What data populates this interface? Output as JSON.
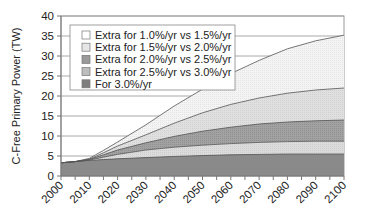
{
  "chart_data": {
    "type": "area",
    "stacked": true,
    "title": "",
    "xlabel": "",
    "ylabel": "C-Free Primary Power (TW)",
    "xlim": [
      2000,
      2100
    ],
    "ylim": [
      0,
      40
    ],
    "x_ticks": [
      2000,
      2010,
      2020,
      2030,
      2040,
      2050,
      2060,
      2070,
      2080,
      2090,
      2100
    ],
    "y_ticks": [
      0,
      5,
      10,
      15,
      20,
      25,
      30,
      35,
      40
    ],
    "grid": {
      "horizontal": true,
      "vertical": false
    },
    "legend_position": "upper-left-inside",
    "x": [
      2000,
      2005,
      2010,
      2015,
      2020,
      2030,
      2040,
      2050,
      2060,
      2070,
      2080,
      2090,
      2100
    ],
    "cumulative_boundaries": [
      {
        "name": "For 3.0%/yr",
        "values": [
          3.3,
          3.6,
          3.9,
          4.1,
          4.3,
          4.6,
          4.9,
          5.1,
          5.3,
          5.4,
          5.5,
          5.5,
          5.5
        ]
      },
      {
        "name": "Total at 2.5%/yr",
        "values": [
          3.3,
          3.6,
          4.0,
          4.7,
          5.4,
          6.5,
          7.2,
          7.7,
          8.1,
          8.4,
          8.6,
          8.7,
          8.7
        ]
      },
      {
        "name": "Total at 2.0%/yr",
        "values": [
          3.3,
          3.6,
          4.1,
          5.3,
          6.5,
          8.3,
          9.9,
          11.2,
          12.2,
          13.0,
          13.5,
          13.8,
          14.0
        ]
      },
      {
        "name": "Total at 1.5%/yr",
        "values": [
          3.3,
          3.6,
          4.2,
          5.8,
          7.5,
          10.3,
          13.2,
          15.8,
          17.9,
          19.5,
          20.7,
          21.5,
          22.0
        ]
      },
      {
        "name": "Total at 1.0%/yr",
        "values": [
          3.3,
          3.6,
          4.4,
          6.4,
          8.5,
          12.8,
          17.5,
          21.7,
          25.6,
          28.9,
          31.8,
          33.8,
          35.2
        ]
      }
    ],
    "series": [
      {
        "name": "For 3.0%/yr",
        "color": "#8a8a8a",
        "values": [
          3.3,
          3.6,
          3.9,
          4.1,
          4.3,
          4.6,
          4.9,
          5.1,
          5.3,
          5.4,
          5.5,
          5.5,
          5.5
        ]
      },
      {
        "name": "Extra for 2.5%/yr vs 3.0%/yr",
        "color": "#b4b4b4",
        "values": [
          0,
          0,
          0.1,
          0.6,
          1.1,
          1.9,
          2.3,
          2.6,
          2.8,
          3.0,
          3.1,
          3.2,
          3.2
        ]
      },
      {
        "name": "Extra for 2.0%/yr vs 2.5%/yr",
        "color": "#9c9c9c",
        "values": [
          0,
          0,
          0.1,
          0.6,
          1.1,
          1.8,
          2.7,
          3.5,
          4.1,
          4.6,
          4.9,
          5.1,
          5.3
        ]
      },
      {
        "name": "Extra for 1.5%/yr vs 2.0%/yr",
        "color": "#dedede",
        "values": [
          0,
          0,
          0.1,
          0.5,
          1.0,
          2.0,
          3.3,
          4.6,
          5.7,
          6.5,
          7.2,
          7.7,
          8.0
        ]
      },
      {
        "name": "Extra for 1.0%/yr vs 1.5%/yr",
        "color": "#f2f2f2",
        "values": [
          0,
          0,
          0.2,
          0.6,
          1.0,
          2.5,
          4.3,
          5.9,
          7.7,
          9.4,
          11.1,
          12.3,
          13.2
        ]
      }
    ]
  },
  "chart": {
    "ylabel": "C-Free Primary Power (TW)",
    "y_tick_labels": [
      "0",
      "5",
      "10",
      "15",
      "20",
      "25",
      "30",
      "35",
      "40"
    ],
    "x_tick_labels": [
      "2000",
      "2010",
      "2020",
      "2030",
      "2040",
      "2050",
      "2060",
      "2070",
      "2080",
      "2090",
      "2100"
    ],
    "legend": [
      {
        "label": "Extra for 1.0%/yr vs 1.5%/yr",
        "color": "#f2f2f2"
      },
      {
        "label": "Extra for 1.5%/yr vs 2.0%/yr",
        "color": "#dedede"
      },
      {
        "label": "Extra for 2.0%/yr vs 2.5%/yr",
        "color": "#9c9c9c"
      },
      {
        "label": "Extra for 2.5%/yr vs 3.0%/yr",
        "color": "#b4b4b4"
      },
      {
        "label": "For 3.0%/yr",
        "color": "#8a8a8a"
      }
    ]
  }
}
